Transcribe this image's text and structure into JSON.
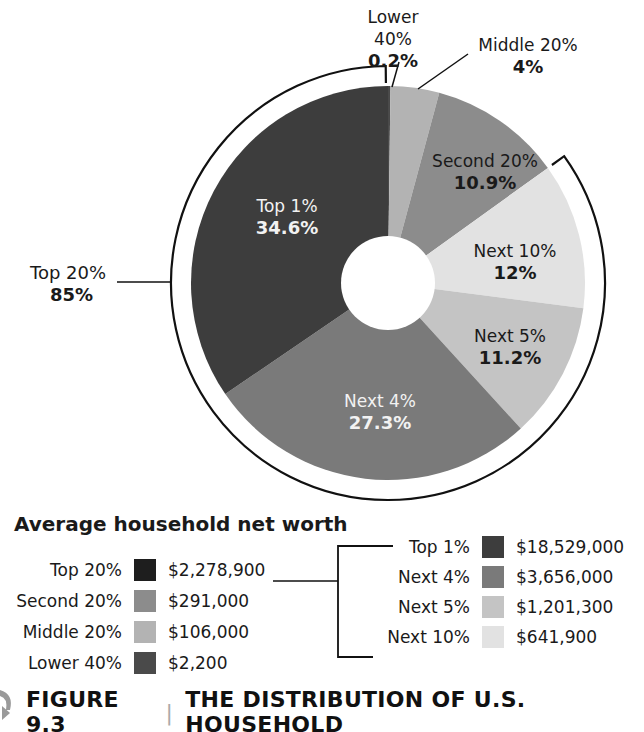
{
  "chart_data": {
    "type": "pie",
    "subtype": "donut",
    "title": "The Distribution of U.S. Household",
    "center": [
      388,
      283
    ],
    "radius": 197,
    "inner_radius": 47,
    "start_angle_deg": 0,
    "direction": "clockwise",
    "slices": [
      {
        "name": "Lower 40%",
        "value": 0.2,
        "label": "0.2%",
        "color": "#4a4a4a"
      },
      {
        "name": "Middle 20%",
        "value": 4,
        "label": "4%",
        "color": "#b3b3b3"
      },
      {
        "name": "Second 20%",
        "value": 10.9,
        "label": "10.9%",
        "color": "#8c8c8c"
      },
      {
        "name": "Next 10%",
        "value": 12,
        "label": "12%",
        "color": "#e2e2e2"
      },
      {
        "name": "Next 5%",
        "value": 11.2,
        "label": "11.2%",
        "color": "#c4c4c4"
      },
      {
        "name": "Next 4%",
        "value": 27.3,
        "label": "27.3%",
        "color": "#7a7a7a"
      },
      {
        "name": "Top 1%",
        "value": 34.6,
        "label": "34.6%",
        "color": "#3d3d3d"
      }
    ],
    "group_bracket": {
      "name": "Top 20%",
      "value": 85,
      "label": "85%",
      "members": [
        "Top 1%",
        "Next 4%",
        "Next 5%",
        "Next 10%"
      ]
    },
    "legend": {
      "title": "Average household net worth",
      "primary": [
        {
          "name": "Top 20%",
          "value": "$2,278,900",
          "color": "#1e1e1e"
        },
        {
          "name": "Second 20%",
          "value": "$291,000",
          "color": "#8c8c8c"
        },
        {
          "name": "Middle 20%",
          "value": "$106,000",
          "color": "#b3b3b3"
        },
        {
          "name": "Lower 40%",
          "value": "$2,200",
          "color": "#4a4a4a"
        }
      ],
      "breakdown": [
        {
          "name": "Top 1%",
          "value": "$18,529,000",
          "color": "#3d3d3d"
        },
        {
          "name": "Next 4%",
          "value": "$3,656,000",
          "color": "#7a7a7a"
        },
        {
          "name": "Next 5%",
          "value": "$1,201,300",
          "color": "#c4c4c4"
        },
        {
          "name": "Next 10%",
          "value": "$641,900",
          "color": "#e2e2e2"
        }
      ]
    }
  },
  "labels": {
    "lower40": {
      "name": "Lower 40%",
      "pct": "0.2%"
    },
    "middle20": {
      "name": "Middle 20%",
      "pct": "4%"
    },
    "second20": {
      "name": "Second 20%",
      "pct": "10.9%"
    },
    "next10": {
      "name": "Next 10%",
      "pct": "12%"
    },
    "next5": {
      "name": "Next 5%",
      "pct": "11.2%"
    },
    "next4": {
      "name": "Next 4%",
      "pct": "27.3%"
    },
    "top1": {
      "name": "Top 1%",
      "pct": "34.6%"
    },
    "top20": {
      "name": "Top 20%",
      "pct": "85%"
    }
  },
  "legend": {
    "title": "Average household net worth",
    "primary": [
      {
        "name": "Top 20%",
        "value": "$2,278,900"
      },
      {
        "name": "Second 20%",
        "value": "$291,000"
      },
      {
        "name": "Middle 20%",
        "value": "$106,000"
      },
      {
        "name": "Lower 40%",
        "value": "$2,200"
      }
    ],
    "breakdown": [
      {
        "name": "Top 1%",
        "value": "$18,529,000"
      },
      {
        "name": "Next 4%",
        "value": "$3,656,000"
      },
      {
        "name": "Next 5%",
        "value": "$1,201,300"
      },
      {
        "name": "Next 10%",
        "value": "$641,900"
      }
    ]
  },
  "caption": {
    "figure": "FIGURE 9.3",
    "separator": "|",
    "title": "THE DISTRIBUTION OF U.S. HOUSEHOLD"
  }
}
